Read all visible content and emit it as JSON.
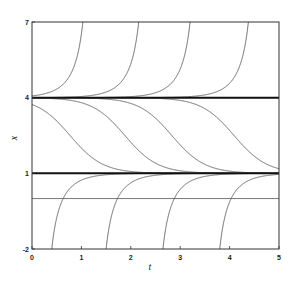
{
  "chart_data": {
    "type": "line",
    "title": "",
    "xlabel": "t",
    "ylabel": "x",
    "xlim": [
      0,
      5
    ],
    "ylim": [
      -2,
      7
    ],
    "xticks": [
      0,
      1,
      2,
      3,
      4,
      5
    ],
    "yticks": [
      -2,
      1,
      4,
      7
    ],
    "grid": false,
    "legend": null,
    "equilibria": [
      {
        "value": 4,
        "style": "thick",
        "label": "x = 4"
      },
      {
        "value": 1,
        "style": "thick",
        "label": "x = 1"
      }
    ],
    "horizontal_lines": [
      {
        "value": 0,
        "style": "thin",
        "label": "x = 0"
      }
    ],
    "series": [
      {
        "name": "blowup-1",
        "description": "leaves x=4, crosses x=7 at t≈1.03",
        "t_top": 1.03
      },
      {
        "name": "blowup-2",
        "description": "leaves x=4, crosses x=7 at t≈2.16",
        "t_top": 2.16
      },
      {
        "name": "blowup-3",
        "description": "leaves x=4, crosses x=7 at t≈3.2",
        "t_top": 3.2
      },
      {
        "name": "blowup-4",
        "description": "leaves x=4, crosses x=7 at t≈4.38",
        "t_top": 4.38
      },
      {
        "name": "decay-1",
        "description": "from x=4 down to x=1, midpoint t≈0.77",
        "t_mid": 0.77
      },
      {
        "name": "decay-2",
        "description": "from x=4 down to x=1, midpoint t≈1.88",
        "t_mid": 1.88
      },
      {
        "name": "decay-3",
        "description": "from x=4 down to x=1, midpoint t≈2.83",
        "t_mid": 2.83
      },
      {
        "name": "decay-4",
        "description": "from x=4 down to x=1, midpoint t≈4.09",
        "t_mid": 4.09
      },
      {
        "name": "rise-1",
        "description": "from x=-2 (t≈0.4) up to x=1",
        "t_bottom": 0.4
      },
      {
        "name": "rise-2",
        "description": "from x=-2 (t≈1.5) up to x=1",
        "t_bottom": 1.5
      },
      {
        "name": "rise-3",
        "description": "from x=-2 (t≈2.65) up to x=1",
        "t_bottom": 2.65
      },
      {
        "name": "rise-4",
        "description": "from x=-2 (t≈3.8) up to x=1",
        "t_bottom": 3.8
      }
    ]
  },
  "axes": {
    "x_label": "t",
    "y_label": "x",
    "x_tick_labels": [
      "0",
      "1",
      "2",
      "3",
      "4",
      "5"
    ],
    "y_tick_labels": [
      "-2",
      "1",
      "4",
      "7"
    ]
  }
}
